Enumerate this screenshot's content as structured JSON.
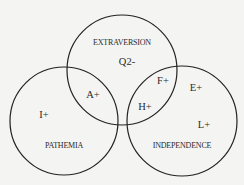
{
  "diagram": {
    "type": "venn",
    "sets": [
      {
        "id": "extraversion",
        "label": "EXTRAVERSION",
        "cx": 122,
        "cy": 70,
        "r": 55
      },
      {
        "id": "pathemia",
        "label": "PATHEMIA",
        "cx": 64,
        "cy": 121,
        "r": 54
      },
      {
        "id": "independence",
        "label": "INDEPENDENCE",
        "cx": 182,
        "cy": 121,
        "r": 55
      }
    ],
    "factors": [
      {
        "label": "Q2-",
        "region": "extraversion only",
        "x": 127,
        "y": 65
      },
      {
        "label": "A+",
        "region": "extraversion ∩ pathemia",
        "x": 93,
        "y": 98
      },
      {
        "label": "I+",
        "region": "pathemia only",
        "x": 44,
        "y": 118
      },
      {
        "label": "F+",
        "region": "extraversion ∩ independence",
        "x": 163,
        "y": 84
      },
      {
        "label": "H+",
        "region": "extraversion ∩ independence",
        "x": 145,
        "y": 110
      },
      {
        "label": "E+",
        "region": "independence only",
        "x": 196,
        "y": 91
      },
      {
        "label": "L+",
        "region": "independence only",
        "x": 204,
        "y": 128
      }
    ],
    "stroke_color": "#222222",
    "background": "#f4f4f2"
  }
}
